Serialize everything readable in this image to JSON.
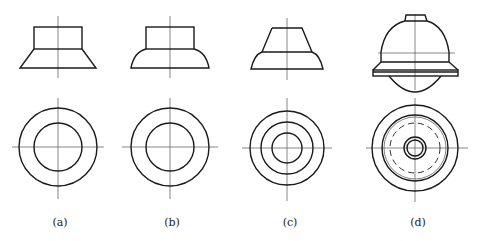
{
  "figures": [
    {
      "id": "a",
      "label": "(a)",
      "description": "Cylinder on truncated cone; top view two concentric circles"
    },
    {
      "id": "b",
      "label": "(b)",
      "description": "Cylinder on spherical segment; top view two concentric circles"
    },
    {
      "id": "c",
      "label": "(c)",
      "description": "Truncated cone on spherical segment; top view three concentric circles"
    },
    {
      "id": "d",
      "label": "(d)",
      "description": "Compound body: small frustum, hemisphere, flange plate, lower spherical cap; top view with hidden (dashed) circle"
    }
  ],
  "colors": {
    "line": "#1a1a1a",
    "centerline": "#555555",
    "background": "#ffffff"
  }
}
